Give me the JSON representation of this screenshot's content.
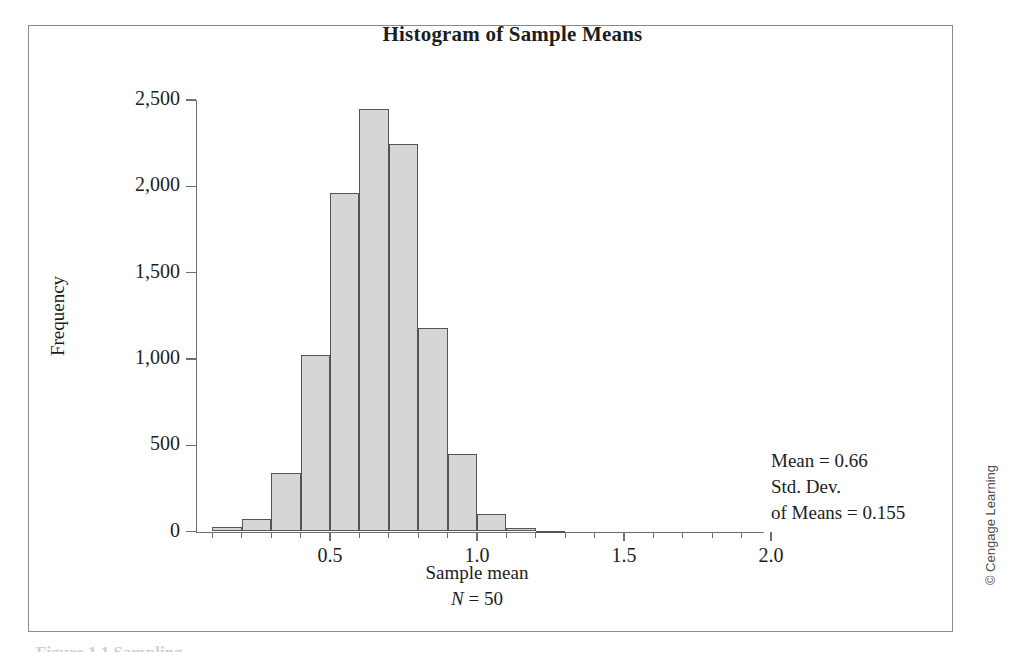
{
  "figure": {
    "title": "Histogram of Sample Means",
    "copyright": "© Cengage Learning",
    "caption_fragment": "Figure 1.1  Sampling"
  },
  "annotation": {
    "line1": "Mean = 0.66",
    "line2": "Std. Dev.",
    "line3": "of Means = 0.155"
  },
  "axis": {
    "y_title": "Frequency",
    "x_title": "Sample mean",
    "x_subtitle_symbol": "N",
    "x_subtitle_rest": " = 50"
  },
  "chart_data": {
    "type": "bar",
    "title": "Histogram of Sample Means",
    "subtitle": "",
    "xlabel": "Sample mean",
    "ylabel": "Frequency",
    "xlim": [
      0.0,
      2.0
    ],
    "ylim": [
      0,
      2500
    ],
    "grid": false,
    "legend": null,
    "bin_width": 0.1,
    "x_tick_labels": [
      "0.5",
      "1.0",
      "1.5",
      "2.0"
    ],
    "x_tick_values": [
      0.5,
      1.0,
      1.5,
      2.0
    ],
    "x_minor_tick_values": [
      0.1,
      0.2,
      0.3,
      0.4,
      0.6,
      0.7,
      0.8,
      0.9,
      1.1,
      1.2,
      1.3,
      1.4,
      1.6,
      1.7,
      1.8,
      1.9
    ],
    "y_tick_labels": [
      "0",
      "500",
      "1,000",
      "1,500",
      "2,000",
      "2,500"
    ],
    "y_tick_values": [
      0,
      500,
      1000,
      1500,
      2000,
      2500
    ],
    "bin_edges": [
      0.1,
      0.2,
      0.3,
      0.4,
      0.5,
      0.6,
      0.7,
      0.8,
      0.9,
      1.0,
      1.1,
      1.2,
      1.3
    ],
    "categories": [
      "0.1-0.2",
      "0.2-0.3",
      "0.3-0.4",
      "0.4-0.5",
      "0.5-0.6",
      "0.6-0.7",
      "0.7-0.8",
      "0.8-0.9",
      "0.9-1.0",
      "1.0-1.1",
      "1.1-1.2",
      "1.2-1.3"
    ],
    "values": [
      25,
      75,
      340,
      1020,
      1960,
      2450,
      2245,
      1180,
      450,
      100,
      20,
      5
    ],
    "annotations": [
      "Mean = 0.66",
      "Std. Dev. of Means = 0.155",
      "N = 50"
    ],
    "bar_fill": "#d6d6d6",
    "bar_edge": "#555555"
  }
}
